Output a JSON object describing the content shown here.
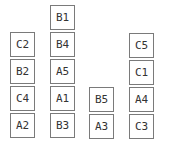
{
  "stacks": [
    {
      "name": "stack-1",
      "left": 10,
      "blocks_top_to_bottom": [
        "C2",
        "B2",
        "C4",
        "A2"
      ]
    },
    {
      "name": "stack-2",
      "left": 50,
      "blocks_top_to_bottom": [
        "B1",
        "B4",
        "A5",
        "A1",
        "B3"
      ]
    },
    {
      "name": "stack-3",
      "left": 89,
      "blocks_top_to_bottom": [
        "B5",
        "A3"
      ]
    },
    {
      "name": "stack-4",
      "left": 129,
      "blocks_top_to_bottom": [
        "C5",
        "C1",
        "A4",
        "C3"
      ]
    }
  ],
  "blocks": {
    "s1_0": "C2",
    "s1_1": "B2",
    "s1_2": "C4",
    "s1_3": "A2",
    "s2_0": "B1",
    "s2_1": "B4",
    "s2_2": "A5",
    "s2_3": "A1",
    "s2_4": "B3",
    "s3_0": "B5",
    "s3_1": "A3",
    "s4_0": "C5",
    "s4_1": "C1",
    "s4_2": "A4",
    "s4_3": "C3"
  }
}
